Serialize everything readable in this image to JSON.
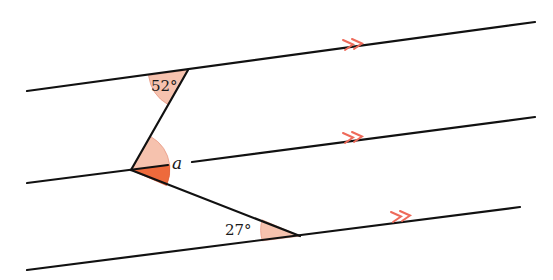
{
  "diagram": {
    "type": "parallel-lines-angles",
    "colors": {
      "line": "#111111",
      "angle_fill_light": "#f6c2ae",
      "angle_fill_dark": "#ee6a3c",
      "arrow_marker": "#ee6a5a"
    },
    "parallel_lines": [
      {
        "name": "top",
        "x1": 27,
        "y1": 91,
        "x2": 535,
        "y2": 22,
        "marker_label": "»"
      },
      {
        "name": "middle",
        "x1": 27,
        "y1": 183,
        "x2": 535,
        "y2": 117,
        "marker_label": "»"
      },
      {
        "name": "bottom",
        "x1": 27,
        "y1": 270,
        "x2": 520,
        "y2": 207,
        "marker_label": "»"
      }
    ],
    "transversal_points": {
      "top_vertex": [
        188,
        70
      ],
      "middle_vertex": [
        131,
        170
      ],
      "bottom_vertex": [
        300,
        236
      ]
    },
    "angles": {
      "top": {
        "label": "52°",
        "value": 52
      },
      "middle": {
        "label": "a"
      },
      "bottom": {
        "label": "27°",
        "value": 27
      }
    }
  }
}
